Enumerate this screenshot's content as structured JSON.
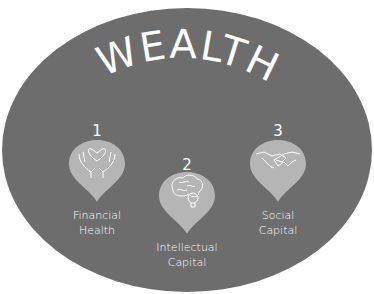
{
  "title": "WEALTH",
  "colors": {
    "background": "#ffffff",
    "ellipse": "#6d6d6d",
    "pin": "#b5b5b5",
    "text": "#ffffff"
  },
  "items": [
    {
      "number": "1",
      "label_line1": "Financial",
      "label_line2": "Health",
      "icon": "hands-heart-icon"
    },
    {
      "number": "2",
      "label_line1": "Intellectual",
      "label_line2": "Capital",
      "icon": "brain-lightbulb-icon"
    },
    {
      "number": "3",
      "label_line1": "Social",
      "label_line2": "Capital",
      "icon": "handshake-icon"
    }
  ]
}
